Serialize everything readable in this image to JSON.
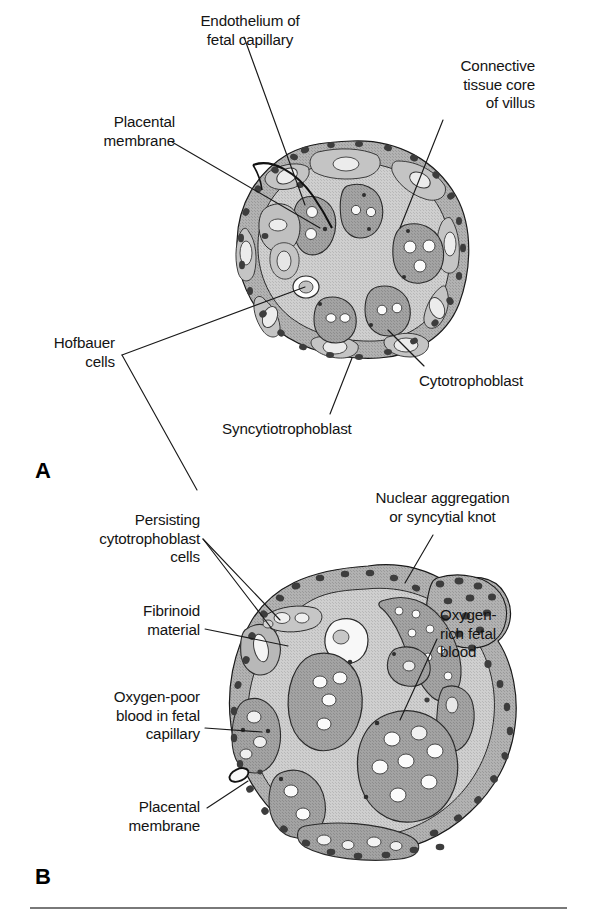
{
  "figure": {
    "background_color": "#ffffff",
    "text_color": "#141414",
    "line_color": "#1a1a1a",
    "palette": {
      "core_fill": "#c9c9c9",
      "trophoblast_fill": "#b3b3b3",
      "capillary_fill": "#9e9e9e",
      "nucleus_fill": "#4a4a4a",
      "blood_cell_fill": "#fbfbfb",
      "fibrinoid_fill": "#f2f2f2",
      "outline": "#1a1a1a"
    },
    "footer_rule": {
      "name": "bottom-divider",
      "y": 908,
      "x1": 30,
      "x2": 567,
      "color": "#4d4d4d"
    }
  },
  "panels": [
    {
      "id": "A",
      "letter": "A",
      "letter_pos": {
        "x": 35,
        "y": 458
      },
      "caption_note": "Early placental villus with thick placental membrane",
      "labels": [
        {
          "name": "label-endothelium-of-fetal-capillary",
          "text": "Endothelium of\nfetal capillary",
          "align": "center",
          "x": 160,
          "y": 12,
          "width": 180
        },
        {
          "name": "label-connective-tissue-core-of-villus",
          "text": "Connective\ntissue core\nof villus",
          "align": "right",
          "x": 380,
          "y": 57,
          "width": 155
        },
        {
          "name": "label-placental-membrane-a",
          "text": "Placental\nmembrane",
          "align": "right",
          "x": 35,
          "y": 113,
          "width": 140
        },
        {
          "name": "label-hofbauer-cells",
          "text": "Hofbauer\ncells",
          "align": "right",
          "x": 10,
          "y": 334,
          "width": 105
        },
        {
          "name": "label-cytotrophoblast",
          "text": "Cytotrophoblast",
          "align": "left",
          "x": 419,
          "y": 372,
          "width": 170
        },
        {
          "name": "label-syncytiotrophoblast",
          "text": "Syncytiotrophoblast",
          "align": "left",
          "x": 222,
          "y": 420,
          "width": 215
        }
      ]
    },
    {
      "id": "B",
      "letter": "B",
      "letter_pos": {
        "x": 35,
        "y": 864
      },
      "caption_note": "Late placental villus with thin placental membrane",
      "labels": [
        {
          "name": "label-nuclear-aggregation-or-syncytial-knot",
          "text": "Nuclear aggregation\nor syncytial knot",
          "align": "center",
          "x": 325,
          "y": 489,
          "width": 235
        },
        {
          "name": "label-persisting-cytotrophoblast-cells",
          "text": "Persisting\ncytotrophoblast\ncells",
          "align": "right",
          "x": 35,
          "y": 511,
          "width": 165
        },
        {
          "name": "label-fibrinoid-material",
          "text": "Fibrinoid\nmaterial",
          "align": "right",
          "x": 55,
          "y": 602,
          "width": 145
        },
        {
          "name": "label-oxygen-rich-fetal-blood",
          "text": "Oxygen-\nrich fetal\nblood",
          "align": "left",
          "x": 440,
          "y": 606,
          "width": 130
        },
        {
          "name": "label-oxygen-poor-blood-in-fetal-capillary",
          "text": "Oxygen-poor\nblood in fetal\ncapillary",
          "align": "right",
          "x": 20,
          "y": 688,
          "width": 180
        },
        {
          "name": "label-placental-membrane-b",
          "text": "Placental\nmembrane",
          "align": "right",
          "x": 55,
          "y": 798,
          "width": 145
        }
      ]
    }
  ],
  "leader_lines": [
    {
      "name": "leader-endothelium-to-capillary",
      "points": "244,37 305,205"
    },
    {
      "name": "leader-connective-tissue-to-core",
      "points": "443,120 400,228"
    },
    {
      "name": "leader-placental-membrane-a",
      "points": "172,142 320,228"
    },
    {
      "name": "leader-hofbauer-upper",
      "points": "122,355 305,287"
    },
    {
      "name": "leader-hofbauer-lower",
      "points": "122,355 197,490"
    },
    {
      "name": "leader-cytotrophoblast",
      "points": "424,366 388,330"
    },
    {
      "name": "leader-syncytiotrophoblast",
      "points": "330,414 352,358"
    },
    {
      "name": "leader-nuclear-aggregation",
      "points": "433,535 405,583"
    },
    {
      "name": "leader-persisting-cytotrophoblast-a",
      "points": "203,539 280,620"
    },
    {
      "name": "leader-persisting-cytotrophoblast-b",
      "points": "203,539 272,629"
    },
    {
      "name": "leader-fibrinoid-material",
      "points": "205,629 288,646"
    },
    {
      "name": "leader-oxygen-rich-fetal-blood",
      "points": "437,639 400,720"
    },
    {
      "name": "leader-oxygen-poor-blood",
      "points": "205,728 262,732"
    },
    {
      "name": "leader-placental-membrane-b",
      "points": "207,808 248,781"
    }
  ],
  "diagram_A": {
    "name": "villus-cross-section-early",
    "center": {
      "cx": 352,
      "cy": 245
    },
    "structures": [
      {
        "name": "syncytiotrophoblast-outer-rim",
        "type": "outer-ring"
      },
      {
        "name": "cytotrophoblast-cell-layer",
        "type": "inner-ring-cells",
        "count": 9
      },
      {
        "name": "connective-tissue-core",
        "type": "core"
      },
      {
        "name": "fetal-capillary",
        "type": "capillary",
        "count": 6
      },
      {
        "name": "hofbauer-cell",
        "type": "hofbauer",
        "count": 1
      },
      {
        "name": "syncytial-nucleus",
        "type": "nucleus-dot",
        "count": 28
      }
    ]
  },
  "diagram_B": {
    "name": "villus-cross-section-late",
    "center": {
      "cx": 368,
      "cy": 712
    },
    "structures": [
      {
        "name": "thin-syncytiotrophoblast-rim",
        "type": "outer-ring"
      },
      {
        "name": "syncytial-knot",
        "type": "knot",
        "count": 3
      },
      {
        "name": "connective-tissue-core",
        "type": "core"
      },
      {
        "name": "fetal-capillary",
        "type": "capillary",
        "count": 9
      },
      {
        "name": "fibrinoid-patch",
        "type": "fibrinoid",
        "count": 1
      },
      {
        "name": "persisting-cytotrophoblast-cell",
        "type": "cytotrophoblast",
        "count": 4
      },
      {
        "name": "syncytial-nucleus",
        "type": "nucleus-dot",
        "count": 46
      }
    ]
  }
}
